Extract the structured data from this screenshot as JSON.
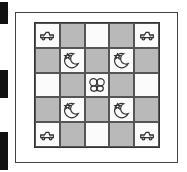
{
  "illustration": {
    "subject": "quilt",
    "grid": [
      [
        "car",
        "dark",
        "light",
        "dark",
        "car"
      ],
      [
        "dark",
        "moon-star",
        "dark",
        "moon-star",
        "dark"
      ],
      [
        "light",
        "dark",
        "butterfly",
        "dark",
        "light"
      ],
      [
        "dark",
        "moon-star",
        "dark",
        "moon-star",
        "dark"
      ],
      [
        "car",
        "dark",
        "light",
        "dark",
        "car"
      ]
    ],
    "colors": {
      "dark_patch": "#b9b9b9",
      "light_patch": "#fbfbfb",
      "outline": "#333333"
    }
  }
}
